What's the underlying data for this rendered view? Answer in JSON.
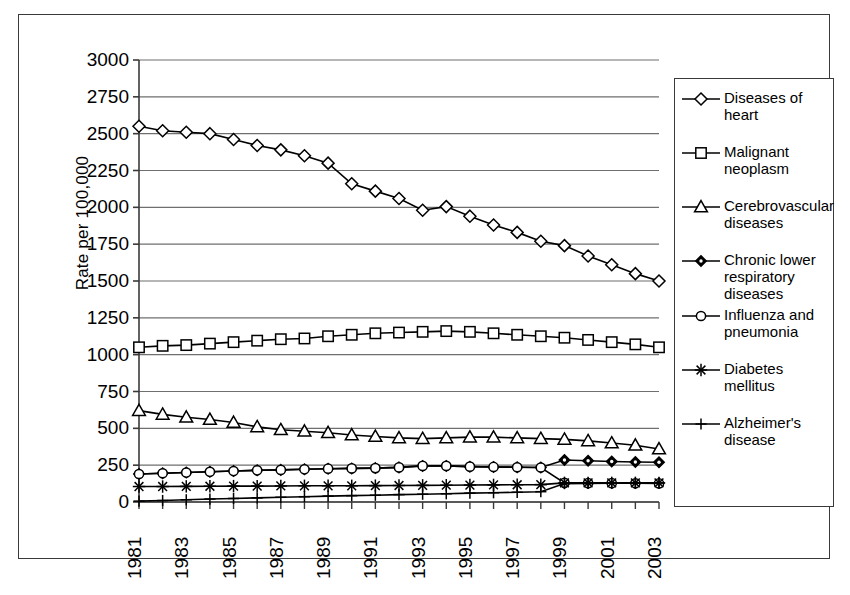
{
  "chart_data": {
    "type": "line",
    "title": "",
    "xlabel": "",
    "ylabel": "Rate per 100,000",
    "ylim": [
      0,
      3000
    ],
    "ytick_step": 250,
    "yticks": [
      0,
      250,
      500,
      750,
      1000,
      1250,
      1500,
      1750,
      2000,
      2250,
      2500,
      2750,
      3000
    ],
    "ytick_labels": [
      "0",
      "250",
      "500",
      "750",
      "1000",
      "1250",
      "1500",
      "1750",
      "2000",
      "2250",
      "2500",
      "2750",
      "3000"
    ],
    "grid": true,
    "legend_position": "right",
    "x": [
      1981,
      1982,
      1983,
      1984,
      1985,
      1986,
      1987,
      1988,
      1989,
      1990,
      1991,
      1992,
      1993,
      1994,
      1995,
      1996,
      1997,
      1998,
      1999,
      2000,
      2001,
      2002,
      2003
    ],
    "xtick_labels": [
      "1981",
      "",
      "1983",
      "",
      "1985",
      "",
      "1987",
      "",
      "1989",
      "",
      "1991",
      "",
      "1993",
      "",
      "1995",
      "",
      "1997",
      "",
      "1999",
      "",
      "2001",
      "",
      "2003"
    ],
    "series": [
      {
        "name": "Diseases of heart",
        "marker": "diamond",
        "values": [
          2550,
          2520,
          2510,
          2500,
          2460,
          2420,
          2390,
          2350,
          2300,
          2160,
          2110,
          2060,
          1980,
          2005,
          1940,
          1880,
          1830,
          1770,
          1740,
          1670,
          1610,
          1550,
          1500
        ]
      },
      {
        "name": "Malignant neoplasm",
        "marker": "square",
        "values": [
          1050,
          1060,
          1065,
          1075,
          1085,
          1095,
          1105,
          1110,
          1125,
          1135,
          1145,
          1150,
          1155,
          1160,
          1155,
          1145,
          1135,
          1125,
          1115,
          1100,
          1085,
          1070,
          1050
        ]
      },
      {
        "name": "Cerebrovascular diseases",
        "marker": "triangle",
        "values": [
          620,
          595,
          575,
          560,
          540,
          510,
          490,
          480,
          470,
          455,
          445,
          435,
          430,
          435,
          440,
          440,
          435,
          430,
          425,
          415,
          400,
          385,
          360
        ]
      },
      {
        "name": "Chronic lower respiratory diseases",
        "marker": "diamond-filled",
        "values": [
          190,
          195,
          200,
          205,
          210,
          215,
          218,
          222,
          226,
          228,
          230,
          235,
          245,
          245,
          240,
          238,
          236,
          234,
          285,
          280,
          275,
          272,
          270
        ]
      },
      {
        "name": "Influenza and pneumonia",
        "marker": "circle",
        "values": [
          190,
          195,
          200,
          205,
          210,
          215,
          218,
          222,
          226,
          228,
          230,
          235,
          245,
          245,
          240,
          238,
          236,
          234,
          130,
          128,
          128,
          127,
          126
        ]
      },
      {
        "name": "Diabetes mellitus",
        "marker": "star",
        "values": [
          105,
          105,
          106,
          107,
          108,
          108,
          109,
          110,
          110,
          110,
          111,
          112,
          113,
          114,
          115,
          116,
          117,
          118,
          130,
          130,
          130,
          130,
          130
        ]
      },
      {
        "name": "Alzheimer's disease",
        "marker": "plus",
        "values": [
          6,
          10,
          15,
          20,
          24,
          28,
          32,
          36,
          40,
          43,
          46,
          50,
          53,
          56,
          60,
          63,
          66,
          70,
          125,
          126,
          127,
          128,
          128
        ]
      }
    ]
  },
  "legend": {
    "items": [
      {
        "label": "Diseases of\nheart",
        "marker": "diamond"
      },
      {
        "label": "Malignant\nneoplasm",
        "marker": "square"
      },
      {
        "label": "Cerebrovascular\ndiseases",
        "marker": "triangle"
      },
      {
        "label": "Chronic lower\nrespiratory\ndiseases",
        "marker": "diamond-filled"
      },
      {
        "label": "Influenza and\npneumonia",
        "marker": "circle"
      },
      {
        "label": "Diabetes\nmellitus",
        "marker": "star"
      },
      {
        "label": "Alzheimer's\ndisease",
        "marker": "plus"
      }
    ]
  },
  "colors": {
    "line": "#000000",
    "grid": "#6f6f6f",
    "axis": "#3a3a3a",
    "background": "#ffffff"
  }
}
